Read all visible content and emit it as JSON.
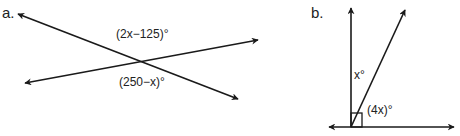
{
  "diagram_a": {
    "part_label": "a.",
    "angle_top": "(2x−125)°",
    "angle_bottom": "(250−x)°",
    "line1": {
      "x1": 18,
      "y1": 14,
      "x2": 238,
      "y2": 99
    },
    "line2": {
      "x1": 25,
      "y1": 83,
      "x2": 258,
      "y2": 40
    }
  },
  "diagram_b": {
    "part_label": "b.",
    "angle_x": "x°",
    "angle_4x": "(4x)°",
    "right_angle_marker": true
  },
  "colors": {
    "line": "#1a1a1a",
    "text": "#222222",
    "background": "#ffffff"
  }
}
